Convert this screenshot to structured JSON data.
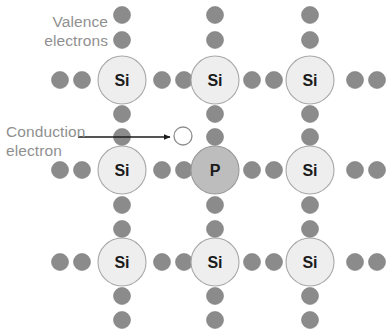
{
  "diagram": {
    "title_labels": {
      "valence_line1": "Valence",
      "valence_line2": "electrons",
      "conduction_line1": "Conduction",
      "conduction_line2": "electron"
    },
    "colors": {
      "background": "#ffffff",
      "label_text": "#909090",
      "electron_fill": "#8b8b8b",
      "electron_stroke": "#7d7d7d",
      "silicon_fill": "#eeeeee",
      "silicon_stroke": "#a8a8a8",
      "phosphorus_fill": "#bdbdbd",
      "phosphorus_stroke": "#9a9a9a",
      "conduction_fill": "#ffffff",
      "conduction_stroke": "#8e8e8e",
      "atom_label_text": "#1b1b1b",
      "arrow": "#1b1b1b"
    },
    "geometry": {
      "width": 390,
      "height": 333,
      "atom_radius": 24,
      "electron_radius": 8.5,
      "conduction_radius": 9,
      "columns_x": [
        122,
        215,
        310
      ],
      "rows_y": [
        80,
        170,
        262
      ]
    },
    "atoms": [
      {
        "symbol": "Si",
        "element": "silicon",
        "row": 0,
        "col": 0,
        "cx": 122,
        "cy": 80
      },
      {
        "symbol": "Si",
        "element": "silicon",
        "row": 0,
        "col": 1,
        "cx": 215,
        "cy": 80
      },
      {
        "symbol": "Si",
        "element": "silicon",
        "row": 0,
        "col": 2,
        "cx": 310,
        "cy": 80
      },
      {
        "symbol": "Si",
        "element": "silicon",
        "row": 1,
        "col": 0,
        "cx": 122,
        "cy": 170
      },
      {
        "symbol": "P",
        "element": "phosphorus",
        "row": 1,
        "col": 1,
        "cx": 215,
        "cy": 170
      },
      {
        "symbol": "Si",
        "element": "silicon",
        "row": 1,
        "col": 2,
        "cx": 310,
        "cy": 170
      },
      {
        "symbol": "Si",
        "element": "silicon",
        "row": 2,
        "col": 0,
        "cx": 122,
        "cy": 262
      },
      {
        "symbol": "Si",
        "element": "silicon",
        "row": 2,
        "col": 1,
        "cx": 215,
        "cy": 262
      },
      {
        "symbol": "Si",
        "element": "silicon",
        "row": 2,
        "col": 2,
        "cx": 310,
        "cy": 262
      }
    ],
    "valence_electrons": [
      {
        "cx": 122,
        "cy": 15
      },
      {
        "cx": 122,
        "cy": 40
      },
      {
        "cx": 215,
        "cy": 15
      },
      {
        "cx": 215,
        "cy": 40
      },
      {
        "cx": 310,
        "cy": 15
      },
      {
        "cx": 310,
        "cy": 40
      },
      {
        "cx": 60,
        "cy": 80
      },
      {
        "cx": 82,
        "cy": 80
      },
      {
        "cx": 162,
        "cy": 80
      },
      {
        "cx": 184,
        "cy": 80
      },
      {
        "cx": 252,
        "cy": 80
      },
      {
        "cx": 274,
        "cy": 80
      },
      {
        "cx": 355,
        "cy": 80
      },
      {
        "cx": 377,
        "cy": 80
      },
      {
        "cx": 122,
        "cy": 114
      },
      {
        "cx": 122,
        "cy": 137
      },
      {
        "cx": 215,
        "cy": 114
      },
      {
        "cx": 215,
        "cy": 137
      },
      {
        "cx": 310,
        "cy": 114
      },
      {
        "cx": 310,
        "cy": 137
      },
      {
        "cx": 60,
        "cy": 170
      },
      {
        "cx": 82,
        "cy": 170
      },
      {
        "cx": 162,
        "cy": 170
      },
      {
        "cx": 184,
        "cy": 170
      },
      {
        "cx": 252,
        "cy": 170
      },
      {
        "cx": 274,
        "cy": 170
      },
      {
        "cx": 355,
        "cy": 170
      },
      {
        "cx": 377,
        "cy": 170
      },
      {
        "cx": 122,
        "cy": 205
      },
      {
        "cx": 122,
        "cy": 229
      },
      {
        "cx": 215,
        "cy": 205
      },
      {
        "cx": 215,
        "cy": 229
      },
      {
        "cx": 310,
        "cy": 205
      },
      {
        "cx": 310,
        "cy": 229
      },
      {
        "cx": 60,
        "cy": 262
      },
      {
        "cx": 82,
        "cy": 262
      },
      {
        "cx": 162,
        "cy": 262
      },
      {
        "cx": 184,
        "cy": 262
      },
      {
        "cx": 252,
        "cy": 262
      },
      {
        "cx": 274,
        "cy": 262
      },
      {
        "cx": 355,
        "cy": 262
      },
      {
        "cx": 377,
        "cy": 262
      },
      {
        "cx": 122,
        "cy": 296
      },
      {
        "cx": 122,
        "cy": 320
      },
      {
        "cx": 215,
        "cy": 296
      },
      {
        "cx": 215,
        "cy": 320
      },
      {
        "cx": 310,
        "cy": 296
      },
      {
        "cx": 310,
        "cy": 320
      }
    ],
    "conduction_electron": {
      "cx": 183,
      "cy": 136,
      "r": 9
    },
    "arrow": {
      "x1": 78,
      "y1": 137,
      "x2": 170,
      "y2": 137
    }
  }
}
